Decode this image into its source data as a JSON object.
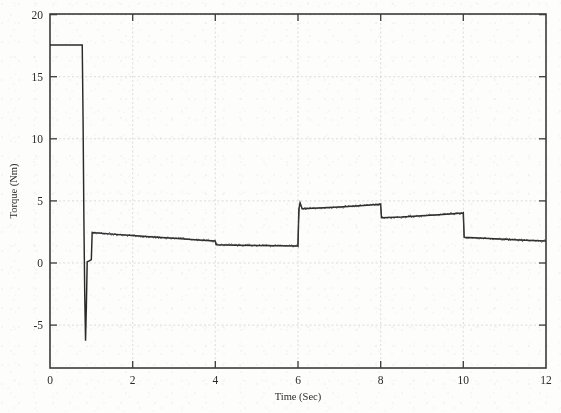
{
  "chart_data": {
    "type": "line",
    "title": "",
    "xlabel": "Time (Sec)",
    "ylabel": "Torque (Nm)",
    "xlim": [
      0,
      12
    ],
    "ylim": [
      -8,
      20.5
    ],
    "grid": true,
    "legend": null,
    "xticks": [
      0,
      2,
      4,
      6,
      8,
      10,
      12
    ],
    "xticklabels": [
      "0",
      "2",
      "4",
      "6",
      "8",
      "10",
      "12"
    ],
    "yticks": [
      -5,
      0,
      5,
      10,
      15,
      20
    ],
    "yticklabels": [
      "-5",
      "0",
      "5",
      "10",
      "15",
      "20"
    ],
    "series": [
      {
        "name": "Torque",
        "description": "Electromagnetic torque response with startup transient and load steps",
        "x": [
          0.0,
          0.78,
          0.8,
          0.82,
          0.84,
          0.86,
          0.88,
          0.9,
          0.95,
          0.99,
          1.0,
          1.02,
          1.5,
          2.0,
          2.5,
          3.0,
          3.5,
          3.99,
          4.0,
          4.02,
          4.5,
          5.0,
          5.5,
          5.99,
          6.0,
          6.02,
          6.05,
          6.1,
          6.5,
          7.0,
          7.5,
          7.99,
          8.0,
          8.02,
          8.5,
          9.0,
          9.5,
          9.99,
          10.0,
          10.02,
          10.5,
          11.0,
          11.5,
          12.0
        ],
        "y": [
          18.0,
          18.0,
          12.0,
          4.0,
          -2.0,
          -5.8,
          -3.0,
          0.55,
          0.62,
          0.7,
          0.72,
          2.9,
          2.78,
          2.66,
          2.54,
          2.44,
          2.33,
          2.22,
          2.2,
          1.92,
          1.89,
          1.86,
          1.84,
          1.82,
          1.8,
          4.78,
          5.3,
          4.82,
          4.88,
          4.96,
          5.06,
          5.18,
          5.2,
          4.1,
          4.16,
          4.26,
          4.36,
          4.48,
          4.5,
          2.52,
          2.44,
          2.36,
          2.28,
          2.22
        ]
      }
    ],
    "annotations": [
      {
        "label": "startup transient",
        "x_range": [
          0.0,
          1.0
        ],
        "peak_high": 18.0,
        "peak_low": -5.8
      },
      {
        "label": "load step 1",
        "x": 1.0,
        "to_value": 2.9
      },
      {
        "label": "load step 2",
        "x": 4.0,
        "to_value": 1.9
      },
      {
        "label": "load step 3",
        "x": 6.0,
        "to_value": 4.8
      },
      {
        "label": "load step 4",
        "x": 8.0,
        "to_value": 4.1
      },
      {
        "label": "load step 5",
        "x": 10.0,
        "to_value": 2.5
      }
    ]
  },
  "figure": {
    "plot_area": {
      "left": 50,
      "top": 14,
      "right": 546,
      "bottom": 368
    },
    "colors": {
      "trace": "#2a2a2a",
      "axis": "#3b3b3b",
      "grid": "#cdcdcd",
      "background": "#fdfdfc"
    }
  }
}
